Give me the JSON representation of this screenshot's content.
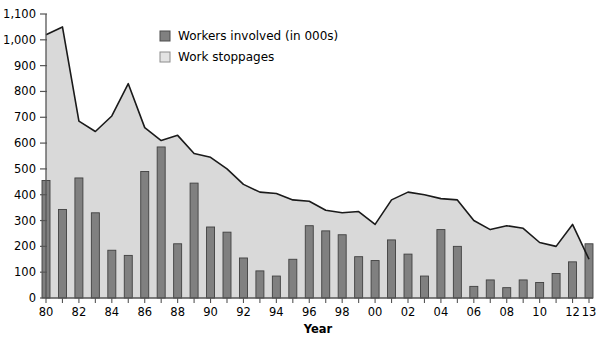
{
  "chart_data": {
    "type": "bar",
    "title": "",
    "xlabel": "Year",
    "ylabel": "",
    "ylim": [
      0,
      1100
    ],
    "ytick_step": 100,
    "grid": false,
    "legend_position": "top-center",
    "categories": [
      "80",
      "81",
      "82",
      "83",
      "84",
      "85",
      "86",
      "87",
      "88",
      "89",
      "90",
      "91",
      "92",
      "93",
      "94",
      "95",
      "96",
      "97",
      "98",
      "99",
      "00",
      "01",
      "02",
      "03",
      "04",
      "05",
      "06",
      "07",
      "08",
      "09",
      "10",
      "11",
      "12",
      "13"
    ],
    "xtick_labels_shown": [
      "80",
      "",
      "82",
      "",
      "84",
      "",
      "86",
      "",
      "88",
      "",
      "90",
      "",
      "92",
      "",
      "94",
      "",
      "96",
      "",
      "98",
      "",
      "00",
      "",
      "02",
      "",
      "04",
      "",
      "06",
      "",
      "08",
      "",
      "10",
      "",
      "12",
      "13"
    ],
    "ytick_labels": [
      "0",
      "100",
      "200",
      "300",
      "400",
      "500",
      "600",
      "700",
      "800",
      "900",
      "1,000",
      "1,100"
    ],
    "series": [
      {
        "name": "Workers involved (in 000s)",
        "type": "bar",
        "color": "#808080",
        "edge_color": "#404040",
        "values": [
          455,
          343,
          465,
          330,
          185,
          165,
          490,
          585,
          210,
          445,
          275,
          255,
          155,
          105,
          85,
          150,
          280,
          260,
          245,
          160,
          145,
          225,
          170,
          85,
          265,
          200,
          45,
          70,
          40,
          70,
          60,
          95,
          140,
          210
        ]
      },
      {
        "name": "Work stoppages",
        "type": "area-line",
        "color": "#d9d9d9",
        "edge_color": "#1a1a1a",
        "values": [
          1020,
          1050,
          685,
          645,
          705,
          830,
          660,
          610,
          630,
          560,
          545,
          500,
          440,
          410,
          405,
          380,
          375,
          340,
          330,
          335,
          285,
          380,
          410,
          400,
          385,
          380,
          300,
          265,
          280,
          270,
          215,
          200,
          285,
          150
        ]
      }
    ],
    "legend": [
      {
        "label": "Workers involved (in 000s)",
        "swatch": "#808080",
        "border": "#4d4d4d"
      },
      {
        "label": "Work stoppages",
        "swatch": "#e3e3e3",
        "border": "#8c8c8c"
      }
    ]
  },
  "axis": {
    "x_title": "Year"
  }
}
